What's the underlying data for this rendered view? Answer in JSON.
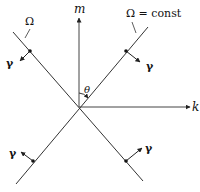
{
  "diagram": {
    "axes": {
      "vertical_label": "m",
      "horizontal_label": "k"
    },
    "angle_label": "θ",
    "line_labels": {
      "left": "Ω",
      "right": "Ω = const"
    },
    "vector_label": "γ",
    "vectors": [
      {
        "position": "upper-left",
        "label": "γ"
      },
      {
        "position": "upper-right",
        "label": "γ"
      },
      {
        "position": "lower-left",
        "label": "γ"
      },
      {
        "position": "lower-right",
        "label": "γ"
      }
    ],
    "colors": {
      "stroke": "#222222",
      "background": "#ffffff"
    }
  }
}
